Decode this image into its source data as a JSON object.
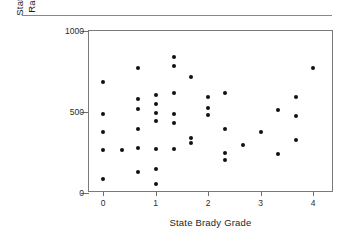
{
  "figure": {
    "top_rule": "horizontal-rule",
    "marker_color": "#111111",
    "axis_color": "#7a7a7a"
  },
  "chart_data": {
    "type": "scatter",
    "title": "",
    "xlabel": "State Brady Grade",
    "ylabel_line1": "State Violent Crime",
    "ylabel_line2": "Rate, per 100,000",
    "ylabel": "State Violent Crime Rate, per 100,000",
    "xlim": [
      -0.27,
      4.4
    ],
    "ylim": [
      0,
      1000
    ],
    "xticks": [
      0,
      1,
      2,
      3,
      4
    ],
    "xticklabels": [
      "0",
      "1",
      "2",
      "3",
      "4"
    ],
    "yticks": [
      0,
      500,
      1000
    ],
    "yticklabels": [
      "0",
      "500",
      "1000"
    ],
    "grid": false,
    "legend": null,
    "marker": "circle",
    "points": [
      {
        "x": 0.0,
        "y": 687
      },
      {
        "x": 0.0,
        "y": 488
      },
      {
        "x": 0.0,
        "y": 375
      },
      {
        "x": 0.0,
        "y": 263
      },
      {
        "x": 0.0,
        "y": 88
      },
      {
        "x": 0.36,
        "y": 263
      },
      {
        "x": 0.67,
        "y": 769
      },
      {
        "x": 0.67,
        "y": 581
      },
      {
        "x": 0.67,
        "y": 519
      },
      {
        "x": 0.67,
        "y": 394
      },
      {
        "x": 0.67,
        "y": 275
      },
      {
        "x": 0.67,
        "y": 131
      },
      {
        "x": 1.0,
        "y": 606
      },
      {
        "x": 1.0,
        "y": 550
      },
      {
        "x": 1.0,
        "y": 494
      },
      {
        "x": 1.0,
        "y": 444
      },
      {
        "x": 1.0,
        "y": 269
      },
      {
        "x": 1.0,
        "y": 150
      },
      {
        "x": 1.0,
        "y": 56
      },
      {
        "x": 1.35,
        "y": 838
      },
      {
        "x": 1.35,
        "y": 781
      },
      {
        "x": 1.35,
        "y": 619
      },
      {
        "x": 1.35,
        "y": 488
      },
      {
        "x": 1.35,
        "y": 431
      },
      {
        "x": 1.35,
        "y": 269
      },
      {
        "x": 1.67,
        "y": 713
      },
      {
        "x": 1.67,
        "y": 338
      },
      {
        "x": 1.67,
        "y": 306
      },
      {
        "x": 2.0,
        "y": 594
      },
      {
        "x": 2.0,
        "y": 525
      },
      {
        "x": 2.0,
        "y": 481
      },
      {
        "x": 2.33,
        "y": 619
      },
      {
        "x": 2.33,
        "y": 394
      },
      {
        "x": 2.33,
        "y": 244
      },
      {
        "x": 2.33,
        "y": 206
      },
      {
        "x": 2.67,
        "y": 294
      },
      {
        "x": 3.0,
        "y": 375
      },
      {
        "x": 3.33,
        "y": 513
      },
      {
        "x": 3.33,
        "y": 238
      },
      {
        "x": 3.67,
        "y": 594
      },
      {
        "x": 3.67,
        "y": 475
      },
      {
        "x": 3.67,
        "y": 325
      },
      {
        "x": 4.0,
        "y": 769
      }
    ]
  }
}
